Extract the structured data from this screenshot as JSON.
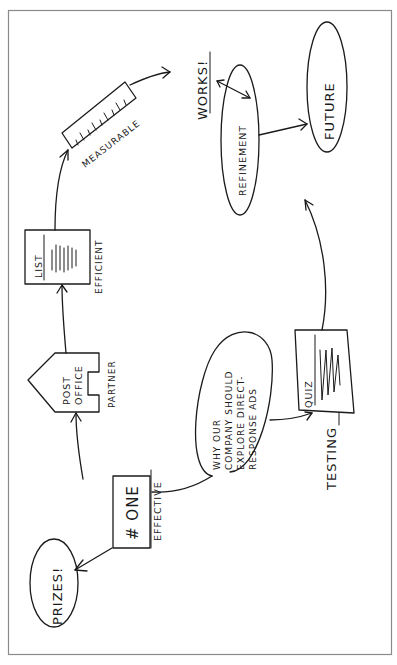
{
  "diagram": {
    "orientation": "rotated-90-ccw",
    "center": {
      "label_lines": [
        "WHY OUR",
        "COMPANY SHOULD",
        "EXPLORE DIRECT-",
        "RESPONSE ADS"
      ]
    },
    "nodes": {
      "one": {
        "label": "# ONE",
        "caption": "EFFECTIVE"
      },
      "prizes": {
        "label": "PRIZES!"
      },
      "post_office": {
        "label_lines": [
          "POST",
          "OFFICE"
        ],
        "caption": "PARTNER"
      },
      "list": {
        "label": "LIST",
        "caption": "EFFICIENT"
      },
      "measurable": {
        "caption": "MEASURABLE"
      },
      "works": {
        "label": "WORKS!"
      },
      "refinement": {
        "label": "REFINEMENT"
      },
      "future": {
        "label": "FUTURE"
      },
      "quiz": {
        "label": "QUIZ",
        "caption": "TESTING"
      }
    },
    "edges": [
      {
        "from": "center",
        "to": "one"
      },
      {
        "from": "one",
        "to": "prizes"
      },
      {
        "from": "one",
        "to": "post_office"
      },
      {
        "from": "post_office",
        "to": "list"
      },
      {
        "from": "list",
        "to": "measurable"
      },
      {
        "from": "measurable",
        "to": "works"
      },
      {
        "from": "works",
        "to": "refinement",
        "bidirectional": true
      },
      {
        "from": "refinement",
        "to": "future"
      },
      {
        "from": "center",
        "to": "quiz"
      },
      {
        "from": "quiz",
        "to": "refinement"
      }
    ],
    "colors": {
      "ink": "#1a1a1a",
      "frame": "#8a8a8a",
      "background": "#ffffff"
    }
  }
}
